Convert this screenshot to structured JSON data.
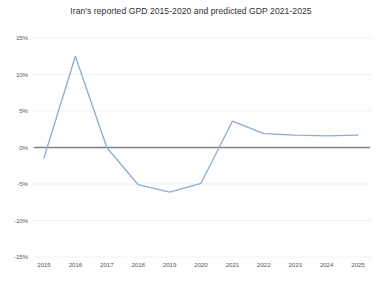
{
  "chart_data": {
    "type": "line",
    "title": "Iran's reported GPD 2015-2020 and predicted GDP 2021-2025",
    "xlabel": "",
    "ylabel": "",
    "categories": [
      "2015",
      "2016",
      "2017",
      "2018",
      "2019",
      "2020",
      "2021",
      "2022",
      "2023",
      "2024",
      "2025"
    ],
    "values": [
      -1.4,
      12.5,
      0.0,
      -5.1,
      -6.1,
      -4.9,
      3.6,
      1.9,
      1.7,
      1.6,
      1.7
    ],
    "series": [
      {
        "name": "GDP growth",
        "values": [
          -1.4,
          12.5,
          0.0,
          -5.1,
          -6.1,
          -4.9,
          3.6,
          1.9,
          1.7,
          1.6,
          1.7
        ],
        "color": "#8EAADC"
      }
    ],
    "ylim": [
      -15,
      15
    ],
    "ytick_values": [
      15,
      10,
      5,
      0,
      -5,
      -10,
      -15
    ],
    "ytick_labels": [
      "15%",
      "10%",
      "5%",
      "0%",
      "-5%",
      "-10%",
      "-15%"
    ],
    "xtick_labels": [
      "2015",
      "2016",
      "2017",
      "2018",
      "2019",
      "2020",
      "2021",
      "2022",
      "2023",
      "2024",
      "2025"
    ],
    "grid": true,
    "legend": false,
    "zero_line": true,
    "colors": {
      "line": "#8EAADC",
      "zero_line": "#808080",
      "gridline": "#ededf2",
      "text": "#5a5a5a",
      "title": "#2f2f2f",
      "background": "#ffffff"
    }
  }
}
